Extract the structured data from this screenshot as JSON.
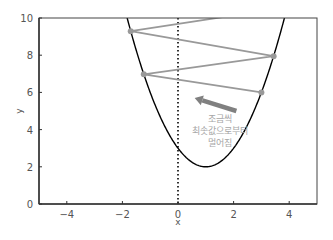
{
  "chart_data": {
    "type": "line",
    "title": "",
    "xlabel": "x",
    "ylabel": "y",
    "xlim": [
      -5,
      5
    ],
    "ylim": [
      0,
      10
    ],
    "xticks": [
      -4,
      -2,
      0,
      2,
      4
    ],
    "yticks": [
      0,
      2,
      4,
      6,
      8,
      10
    ],
    "xtick_labels": [
      "−4",
      "−2",
      "0",
      "2",
      "4"
    ],
    "ytick_labels": [
      "0",
      "2",
      "4",
      "6",
      "8",
      "10"
    ],
    "grid": false,
    "legend": null,
    "series": [
      {
        "name": "function",
        "kind": "curve",
        "formula": "y = (x - 1)^2 + 2",
        "x_range": [
          -5,
          5
        ],
        "color": "#000000"
      },
      {
        "name": "gradient-descent-steps",
        "kind": "line+markers",
        "color": "#999999",
        "points": [
          {
            "x": 3.0,
            "y": 6.0
          },
          {
            "x": -1.23,
            "y": 6.97
          },
          {
            "x": 3.44,
            "y": 7.95
          },
          {
            "x": -1.7,
            "y": 9.29
          },
          {
            "x": 4.0,
            "y": 10.6
          }
        ],
        "marker_on_points": [
          0,
          1,
          2,
          3
        ]
      },
      {
        "name": "x=0 reference",
        "kind": "vertical-dotted-line",
        "x": 0,
        "color": "#000000"
      }
    ],
    "annotations": [
      {
        "type": "arrow",
        "from": {
          "x": 2.1,
          "y": 5.0
        },
        "to": {
          "x": 0.6,
          "y": 5.7
        },
        "color": "#808080"
      },
      {
        "type": "text",
        "lines": [
          "조금씩",
          "최솟값으로부터",
          "멀어짐"
        ],
        "x": 1.5,
        "y": 4.4,
        "color": "#a6a6a6"
      }
    ]
  },
  "annotation": {
    "line1": "조금씩",
    "line2": "최솟값으로부터",
    "line3": "멀어짐"
  },
  "axes": {
    "xlabel": "x",
    "ylabel": "y"
  }
}
